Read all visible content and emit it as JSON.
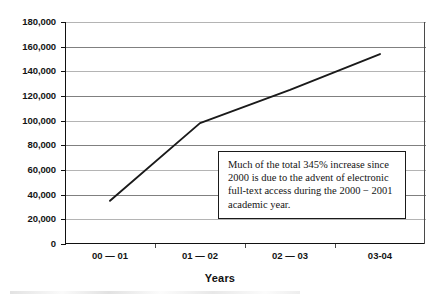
{
  "chart_data": {
    "type": "line",
    "title": "",
    "xlabel": "Years",
    "ylabel": "",
    "categories": [
      "00 — 01",
      "01 — 02",
      "02 — 03",
      "03-04"
    ],
    "values": [
      35000,
      98000,
      125000,
      154000
    ],
    "series": [
      {
        "name": "Full-text access usage",
        "values": [
          35000,
          98000,
          125000,
          154000
        ]
      }
    ],
    "ylim": [
      0,
      180000
    ],
    "ytick_values": [
      0,
      20000,
      40000,
      60000,
      80000,
      100000,
      120000,
      140000,
      160000,
      180000
    ],
    "ytick_labels": [
      "0",
      "20,000",
      "40,000",
      "60,000",
      "80,000",
      "100,000",
      "120,000",
      "140,000",
      "160,000",
      "180,000"
    ],
    "grid": true,
    "legend": false,
    "legend_position": "none",
    "line_color": "#1a1a1a",
    "annotations": [
      {
        "text": "Much of the total 345% increase since 2000 is due to the advent of electronic full-text access during the 2000 − 2001 academic year.",
        "lines": [
          "Much of the total 345% increase since",
          "2000 is due to the advent of electronic",
          "full-text access during the 2000 − 2001",
          "academic year."
        ]
      }
    ]
  },
  "axes": {
    "x_title": "Years"
  }
}
